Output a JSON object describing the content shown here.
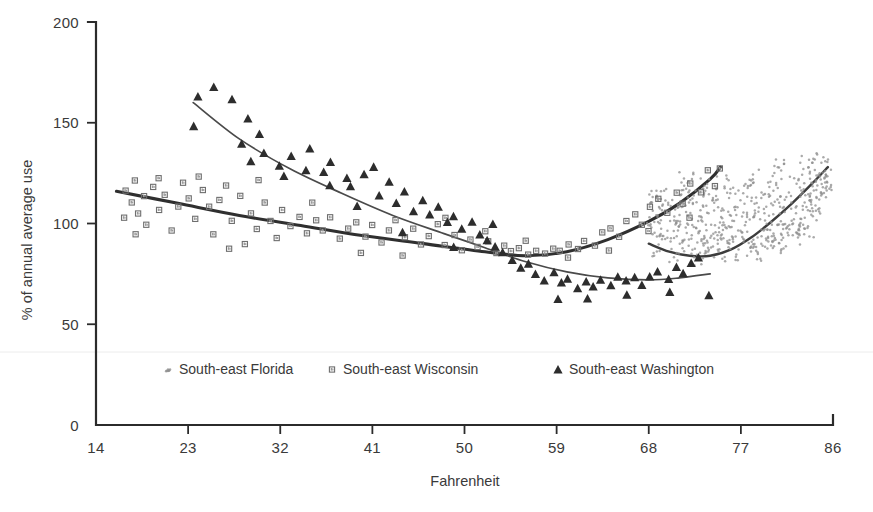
{
  "chart_data": {
    "type": "scatter",
    "title": "",
    "xlabel": "Fahrenheit",
    "ylabel": "% of annual average use",
    "xlim": [
      14,
      86
    ],
    "ylim": [
      0,
      200
    ],
    "xticks": [
      14,
      23,
      32,
      41,
      50,
      59,
      68,
      77,
      86
    ],
    "yticks": [
      0,
      50,
      100,
      150,
      200
    ],
    "grid": false,
    "legend_position": "inside-bottom-center",
    "series": [
      {
        "name": "South-east Florida",
        "marker": "dot",
        "points": [
          [
            68.5,
            101
          ],
          [
            69.2,
            108
          ],
          [
            69.8,
            96
          ],
          [
            70.4,
            112
          ],
          [
            71.0,
            99
          ],
          [
            71.5,
            105
          ],
          [
            72.1,
            94
          ],
          [
            72.6,
            116
          ],
          [
            73.2,
            103
          ],
          [
            73.7,
            91
          ],
          [
            74.3,
            110
          ],
          [
            74.8,
            98
          ],
          [
            75.4,
            118
          ],
          [
            75.9,
            104
          ],
          [
            76.5,
            93
          ],
          [
            77.0,
            112
          ],
          [
            77.6,
            101
          ],
          [
            78.1,
            122
          ],
          [
            78.7,
            108
          ],
          [
            79.2,
            97
          ],
          [
            79.8,
            115
          ],
          [
            80.3,
            105
          ],
          [
            80.9,
            126
          ],
          [
            81.4,
            112
          ],
          [
            82.0,
            100
          ],
          [
            82.5,
            119
          ],
          [
            83.1,
            109
          ],
          [
            83.6,
            128
          ],
          [
            84.2,
            117
          ],
          [
            84.7,
            124
          ],
          [
            69.0,
            89
          ],
          [
            70.8,
            86
          ],
          [
            72.9,
            85
          ],
          [
            74.0,
            88
          ],
          [
            76.0,
            87
          ],
          [
            77.9,
            90
          ],
          [
            79.5,
            92
          ],
          [
            81.0,
            95
          ],
          [
            82.8,
            99
          ],
          [
            84.0,
            106
          ],
          [
            85.0,
            130
          ],
          [
            85.3,
            121
          ],
          [
            68.8,
            113
          ],
          [
            71.8,
            120
          ],
          [
            73.5,
            117
          ],
          [
            75.0,
            92
          ],
          [
            78.4,
            86
          ],
          [
            80.6,
            90
          ],
          [
            83.3,
            95
          ],
          [
            84.5,
            113
          ]
        ],
        "fit_curve": [
          [
            68,
            90
          ],
          [
            70,
            86
          ],
          [
            72,
            84
          ],
          [
            74,
            84
          ],
          [
            76,
            87
          ],
          [
            78,
            93
          ],
          [
            80,
            101
          ],
          [
            82,
            110
          ],
          [
            84,
            120
          ],
          [
            85.5,
            128
          ]
        ]
      },
      {
        "name": "South-east Wisconsin",
        "marker": "square",
        "points": [
          [
            17.0,
            116
          ],
          [
            17.4,
            110
          ],
          [
            17.8,
            121
          ],
          [
            18.2,
            105
          ],
          [
            18.6,
            113
          ],
          [
            19.0,
            99
          ],
          [
            19.6,
            118
          ],
          [
            20.2,
            107
          ],
          [
            20.8,
            114
          ],
          [
            21.4,
            96
          ],
          [
            22.0,
            109
          ],
          [
            22.6,
            120
          ],
          [
            23.2,
            112
          ],
          [
            23.8,
            103
          ],
          [
            24.4,
            117
          ],
          [
            25.0,
            108
          ],
          [
            25.6,
            94
          ],
          [
            26.2,
            111
          ],
          [
            26.8,
            119
          ],
          [
            27.4,
            101
          ],
          [
            28.0,
            113
          ],
          [
            28.6,
            90
          ],
          [
            29.2,
            105
          ],
          [
            29.8,
            97
          ],
          [
            30.4,
            110
          ],
          [
            31.0,
            102
          ],
          [
            31.6,
            93
          ],
          [
            32.2,
            106
          ],
          [
            33.0,
            99
          ],
          [
            33.8,
            104
          ],
          [
            34.6,
            95
          ],
          [
            35.4,
            101
          ],
          [
            36.2,
            97
          ],
          [
            37.0,
            103
          ],
          [
            37.8,
            92
          ],
          [
            38.6,
            98
          ],
          [
            39.4,
            100
          ],
          [
            40.2,
            94
          ],
          [
            41.0,
            99
          ],
          [
            41.8,
            91
          ],
          [
            42.6,
            96
          ],
          [
            43.4,
            102
          ],
          [
            44.2,
            93
          ],
          [
            45.0,
            97
          ],
          [
            45.8,
            89
          ],
          [
            46.6,
            94
          ],
          [
            47.4,
            99
          ],
          [
            48.2,
            90
          ],
          [
            49.0,
            95
          ],
          [
            49.8,
            87
          ],
          [
            50.6,
            92
          ],
          [
            51.4,
            88
          ],
          [
            52.2,
            91
          ],
          [
            53.0,
            85
          ],
          [
            53.8,
            89
          ],
          [
            54.6,
            86
          ],
          [
            55.4,
            88
          ],
          [
            56.2,
            84
          ],
          [
            57.0,
            87
          ],
          [
            57.8,
            85
          ],
          [
            58.6,
            88
          ],
          [
            59.4,
            86
          ],
          [
            60.2,
            90
          ],
          [
            61.0,
            88
          ],
          [
            61.8,
            92
          ],
          [
            62.6,
            89
          ],
          [
            63.4,
            95
          ],
          [
            64.2,
            97
          ],
          [
            65.0,
            93
          ],
          [
            65.8,
            101
          ],
          [
            66.6,
            104
          ],
          [
            67.4,
            99
          ],
          [
            68.2,
            108
          ],
          [
            69.0,
            112
          ],
          [
            69.8,
            106
          ],
          [
            70.6,
            116
          ],
          [
            71.4,
            110
          ],
          [
            72.2,
            120
          ],
          [
            73.0,
            115
          ],
          [
            73.8,
            126
          ],
          [
            74.6,
            119
          ],
          [
            75.0,
            128
          ],
          [
            16.8,
            103
          ],
          [
            18.0,
            95
          ],
          [
            20.0,
            122
          ],
          [
            24.0,
            123
          ],
          [
            27.0,
            88
          ],
          [
            30.0,
            121
          ],
          [
            35.0,
            110
          ],
          [
            40.0,
            86
          ],
          [
            44.0,
            84
          ],
          [
            48.0,
            103
          ],
          [
            52.0,
            96
          ],
          [
            56.0,
            92
          ],
          [
            60.0,
            83
          ],
          [
            64.0,
            86
          ],
          [
            68.0,
            96
          ],
          [
            72.0,
            103
          ]
        ],
        "fit_curve": [
          [
            16,
            116
          ],
          [
            22,
            110
          ],
          [
            28,
            104
          ],
          [
            34,
            99
          ],
          [
            40,
            94
          ],
          [
            46,
            90
          ],
          [
            52,
            86
          ],
          [
            56,
            84
          ],
          [
            60,
            86
          ],
          [
            64,
            92
          ],
          [
            68,
            101
          ],
          [
            71,
            110
          ],
          [
            74,
            122
          ],
          [
            75,
            128
          ]
        ]
      },
      {
        "name": "South-east Washington",
        "marker": "triangle",
        "points": [
          [
            24.0,
            163
          ],
          [
            25.4,
            167
          ],
          [
            27.2,
            161
          ],
          [
            23.6,
            148
          ],
          [
            28.2,
            140
          ],
          [
            29.0,
            131
          ],
          [
            30.4,
            135
          ],
          [
            31.8,
            129
          ],
          [
            33.0,
            133
          ],
          [
            34.4,
            127
          ],
          [
            35.0,
            137
          ],
          [
            36.2,
            126
          ],
          [
            37.0,
            130
          ],
          [
            38.4,
            122
          ],
          [
            39.0,
            118
          ],
          [
            40.2,
            124
          ],
          [
            41.0,
            128
          ],
          [
            41.8,
            114
          ],
          [
            42.6,
            120
          ],
          [
            43.4,
            110
          ],
          [
            44.2,
            116
          ],
          [
            45.0,
            106
          ],
          [
            45.8,
            112
          ],
          [
            46.6,
            104
          ],
          [
            47.4,
            109
          ],
          [
            48.2,
            100
          ],
          [
            49.0,
            103
          ],
          [
            49.8,
            97
          ],
          [
            50.6,
            101
          ],
          [
            51.4,
            95
          ],
          [
            52.2,
            92
          ],
          [
            53.0,
            88
          ],
          [
            53.8,
            85
          ],
          [
            54.6,
            82
          ],
          [
            55.4,
            78
          ],
          [
            56.2,
            80
          ],
          [
            57.0,
            75
          ],
          [
            57.8,
            72
          ],
          [
            58.6,
            76
          ],
          [
            59.4,
            70
          ],
          [
            60.2,
            73
          ],
          [
            61.0,
            68
          ],
          [
            61.8,
            71
          ],
          [
            62.6,
            69
          ],
          [
            63.4,
            72
          ],
          [
            64.2,
            70
          ],
          [
            65.0,
            73
          ],
          [
            65.8,
            71
          ],
          [
            66.6,
            74
          ],
          [
            67.4,
            70
          ],
          [
            68.2,
            73
          ],
          [
            69.0,
            76
          ],
          [
            69.8,
            72
          ],
          [
            70.6,
            78
          ],
          [
            71.4,
            75
          ],
          [
            72.2,
            80
          ],
          [
            73.0,
            83
          ],
          [
            73.8,
            64
          ],
          [
            59.0,
            62
          ],
          [
            62.0,
            63
          ],
          [
            66.0,
            65
          ],
          [
            70.0,
            66
          ],
          [
            48.8,
            88
          ],
          [
            52.8,
            99
          ],
          [
            44.0,
            96
          ],
          [
            39.6,
            108
          ],
          [
            36.8,
            119
          ],
          [
            32.4,
            124
          ],
          [
            30.0,
            145
          ],
          [
            28.8,
            152
          ]
        ],
        "fit_curve": [
          [
            23.5,
            160
          ],
          [
            28,
            142
          ],
          [
            33,
            127
          ],
          [
            38,
            115
          ],
          [
            43,
            104
          ],
          [
            48,
            95
          ],
          [
            52,
            88
          ],
          [
            56,
            81
          ],
          [
            60,
            76
          ],
          [
            64,
            73
          ],
          [
            68,
            72
          ],
          [
            71,
            73
          ],
          [
            74,
            75
          ]
        ]
      }
    ]
  },
  "legend": {
    "items": [
      {
        "label": "South-east Florida",
        "marker": "dot"
      },
      {
        "label": "South-east Wisconsin",
        "marker": "square"
      },
      {
        "label": "South-east Washington",
        "marker": "triangle"
      }
    ]
  },
  "axes": {
    "x_title": "Fahrenheit",
    "y_title": "% of annual average use",
    "x_tick_labels": [
      "14",
      "23",
      "32",
      "41",
      "50",
      "59",
      "68",
      "77",
      "86"
    ],
    "y_tick_labels": [
      "0",
      "50",
      "100",
      "150",
      "200"
    ]
  },
  "colors": {
    "axis": "#2b2b2b",
    "text": "#3a3a3a",
    "florida": "#8e8e8e",
    "wisconsin": "#6e6e6e",
    "washington": "#2d2d2d",
    "background": "#ffffff"
  }
}
